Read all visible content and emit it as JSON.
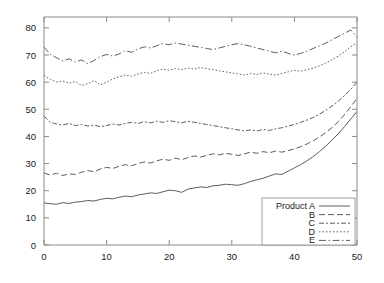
{
  "chart_data": {
    "type": "line",
    "title": "",
    "xlabel": "",
    "ylabel": "",
    "xlim": [
      0,
      50
    ],
    "ylim": [
      0,
      84
    ],
    "grid": false,
    "legend_position": "bottom-right",
    "xticks": [
      0,
      10,
      20,
      30,
      40,
      50
    ],
    "yticks": [
      0,
      10,
      20,
      30,
      40,
      50,
      60,
      70,
      80
    ],
    "xticklabels": [
      "0",
      "10",
      "20",
      "30",
      "40",
      "50"
    ],
    "yticklabels": [
      "0",
      "10",
      "20",
      "30",
      "40",
      "50",
      "60",
      "70",
      "80"
    ],
    "x": [
      0,
      1,
      2,
      3,
      4,
      5,
      6,
      7,
      8,
      9,
      10,
      11,
      12,
      13,
      14,
      15,
      16,
      17,
      18,
      19,
      20,
      21,
      22,
      23,
      24,
      25,
      26,
      27,
      28,
      29,
      30,
      31,
      32,
      33,
      34,
      35,
      36,
      37,
      38,
      39,
      40,
      41,
      42,
      43,
      44,
      45,
      46,
      47,
      48,
      49,
      50
    ],
    "series": [
      {
        "name": "Product A",
        "linestyle": "solid",
        "dasharray": "",
        "color": "#4a4a4a",
        "values": [
          15.5,
          15.2,
          15.0,
          15.6,
          15.3,
          15.8,
          16.0,
          16.4,
          16.2,
          16.8,
          17.2,
          17.0,
          17.6,
          18.0,
          17.8,
          18.4,
          18.8,
          19.2,
          19.0,
          19.6,
          20.2,
          20.0,
          19.4,
          20.6,
          21.0,
          21.4,
          21.2,
          21.8,
          22.0,
          22.4,
          22.2,
          22.0,
          22.6,
          23.4,
          24.0,
          24.6,
          25.4,
          26.2,
          26.0,
          27.2,
          28.4,
          29.6,
          31.0,
          32.6,
          34.4,
          36.4,
          38.6,
          41.0,
          43.6,
          46.4,
          49.2
        ]
      },
      {
        "name": "B",
        "linestyle": "dashed",
        "dasharray": "6,3",
        "color": "#4a4a4a",
        "values": [
          26.5,
          25.8,
          26.4,
          25.6,
          26.2,
          26.0,
          26.8,
          27.4,
          27.0,
          28.0,
          28.6,
          28.2,
          29.0,
          29.6,
          29.2,
          30.0,
          30.6,
          30.2,
          31.0,
          31.6,
          31.2,
          32.0,
          31.4,
          32.2,
          32.8,
          32.4,
          33.0,
          33.6,
          33.2,
          33.8,
          33.4,
          33.0,
          33.6,
          34.2,
          33.8,
          34.4,
          34.0,
          34.6,
          34.2,
          34.8,
          35.4,
          36.2,
          37.2,
          38.4,
          39.8,
          41.4,
          43.2,
          45.4,
          48.0,
          51.0,
          54.0
        ]
      },
      {
        "name": "C",
        "linestyle": "dashdot-long",
        "dasharray": "5,2,2,2",
        "color": "#4a4a4a",
        "values": [
          47.5,
          45.2,
          44.6,
          44.2,
          44.8,
          44.0,
          44.4,
          43.8,
          44.2,
          43.6,
          44.0,
          44.6,
          44.2,
          44.8,
          45.2,
          44.8,
          45.4,
          45.0,
          45.6,
          45.2,
          45.8,
          45.4,
          45.0,
          45.6,
          45.2,
          44.8,
          44.4,
          44.0,
          43.6,
          43.2,
          42.8,
          42.4,
          42.0,
          42.4,
          42.0,
          42.6,
          42.2,
          42.8,
          43.2,
          43.8,
          44.4,
          45.2,
          46.0,
          47.0,
          48.2,
          49.6,
          51.2,
          53.0,
          55.0,
          57.4,
          60.0
        ]
      },
      {
        "name": "D",
        "linestyle": "dotted",
        "dasharray": "1.5,2",
        "color": "#4a4a4a",
        "values": [
          62.5,
          61.0,
          60.0,
          60.4,
          59.6,
          60.2,
          58.8,
          59.4,
          60.6,
          59.0,
          60.0,
          61.2,
          62.0,
          62.6,
          62.2,
          63.0,
          63.6,
          63.2,
          64.2,
          64.8,
          64.4,
          65.0,
          64.6,
          65.2,
          64.8,
          65.4,
          65.0,
          64.6,
          64.2,
          63.8,
          63.4,
          63.0,
          62.6,
          63.2,
          62.8,
          63.4,
          63.0,
          62.6,
          63.2,
          63.8,
          64.4,
          64.0,
          64.6,
          65.2,
          66.0,
          67.0,
          68.2,
          69.6,
          71.2,
          73.0,
          74.5
        ]
      },
      {
        "name": "E",
        "linestyle": "dashdot",
        "dasharray": "7,2.5,1.5,2.5",
        "color": "#4a4a4a",
        "values": [
          73.0,
          70.2,
          69.0,
          67.8,
          68.6,
          67.4,
          68.2,
          66.8,
          68.0,
          69.4,
          70.2,
          69.6,
          70.4,
          71.6,
          71.0,
          72.2,
          73.0,
          72.6,
          73.4,
          74.2,
          73.8,
          74.4,
          74.0,
          73.6,
          73.2,
          72.8,
          72.4,
          72.0,
          72.6,
          73.2,
          73.8,
          74.2,
          73.8,
          73.2,
          72.6,
          72.0,
          71.4,
          70.8,
          71.4,
          70.6,
          70.0,
          70.6,
          71.4,
          72.4,
          73.4,
          74.4,
          75.6,
          76.8,
          78.0,
          79.2,
          76.5
        ]
      }
    ]
  },
  "legend": {
    "entries": [
      {
        "label": "Product A"
      },
      {
        "label": "B"
      },
      {
        "label": "C"
      },
      {
        "label": "D"
      },
      {
        "label": "E"
      }
    ]
  }
}
